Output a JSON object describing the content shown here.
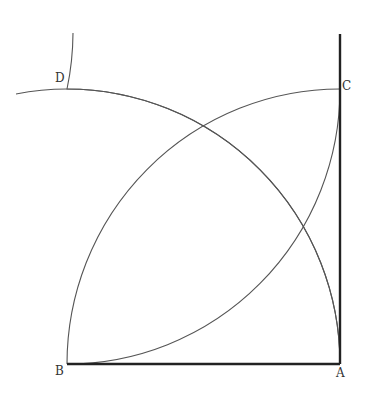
{
  "diagram": {
    "type": "geometric-construction",
    "points": {
      "A": {
        "label": "A",
        "x": 340,
        "y": 364
      },
      "B": {
        "label": "B",
        "x": 67,
        "y": 364
      },
      "C": {
        "label": "C",
        "x": 340,
        "y": 89
      },
      "D": {
        "label": "D",
        "x": 67,
        "y": 89
      }
    },
    "side_length_px": 274,
    "arcs": [
      {
        "center": "B",
        "from": "A",
        "to": "D",
        "extends_to": "left of D"
      },
      {
        "center": "A",
        "from": "B",
        "to": "C"
      },
      {
        "center": "D",
        "from": "B",
        "to": "C"
      },
      {
        "center": "C",
        "from": "A",
        "to": "D",
        "extends_to": "above D"
      }
    ],
    "drawn_sides": [
      "BA",
      "AC (extended above C)"
    ],
    "colors": {
      "line": "#222222",
      "arc": "#555555",
      "background": "#ffffff"
    }
  }
}
